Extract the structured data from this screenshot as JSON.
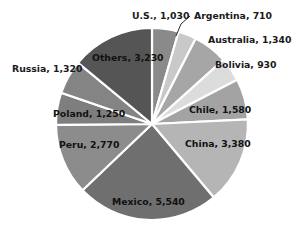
{
  "chart_data": {
    "type": "pie",
    "title": "",
    "subtitle": "",
    "xlabel": "",
    "ylabel": "",
    "legend_position": "none",
    "grid": false,
    "total": 24080,
    "categories": [
      "U.S.",
      "Argentina",
      "Australia",
      "Bolivia",
      "Chile",
      "China",
      "Mexico",
      "Peru",
      "Poland",
      "Russia",
      "Others"
    ],
    "values": [
      1030,
      710,
      1340,
      930,
      1580,
      3380,
      5540,
      2770,
      1250,
      1320,
      3230
    ],
    "slices": [
      {
        "label": "U.S., 1,030",
        "name": "U.S.",
        "value": 1030,
        "color": "#8a8a8a",
        "label_place": "outside"
      },
      {
        "label": "Argentina, 710",
        "name": "Argentina",
        "value": 710,
        "color": "#c9c9c9",
        "label_place": "outside-leader"
      },
      {
        "label": "Australia, 1,340",
        "name": "Australia",
        "value": 1340,
        "color": "#a6a6a6",
        "label_place": "outside"
      },
      {
        "label": "Bolivia, 930",
        "name": "Bolivia",
        "value": 930,
        "color": "#dcdcdc",
        "label_place": "outside"
      },
      {
        "label": "Chile, 1,580",
        "name": "Chile",
        "value": 1580,
        "color": "#a3a3a3",
        "label_place": "inside"
      },
      {
        "label": "China, 3,380",
        "name": "China",
        "value": 3380,
        "color": "#b5b5b5",
        "label_place": "inside"
      },
      {
        "label": "Mexico, 5,540",
        "name": "Mexico",
        "value": 5540,
        "color": "#6f6f6f",
        "label_place": "inside"
      },
      {
        "label": "Peru, 2,770",
        "name": "Peru",
        "value": 2770,
        "color": "#8c8c8c",
        "label_place": "inside"
      },
      {
        "label": "Poland, 1,250",
        "name": "Poland",
        "value": 1250,
        "color": "#7e7e7e",
        "label_place": "inside"
      },
      {
        "label": "Russia, 1,320",
        "name": "Russia",
        "value": 1320,
        "color": "#848484",
        "label_place": "outside"
      },
      {
        "label": "Others, 3,230",
        "name": "Others",
        "value": 3230,
        "color": "#555555",
        "label_place": "inside"
      }
    ],
    "geometry": {
      "center_x": 152,
      "center_y": 124,
      "radius": 96,
      "start_angle_deg": -90
    },
    "label_positions": [
      {
        "key": "U.S.",
        "x": 132,
        "y": 19,
        "anchor": "start"
      },
      {
        "key": "Argentina",
        "x": 194,
        "y": 19,
        "anchor": "start"
      },
      {
        "key": "Australia",
        "x": 208,
        "y": 43,
        "anchor": "start"
      },
      {
        "key": "Bolivia",
        "x": 215,
        "y": 68,
        "anchor": "start"
      },
      {
        "key": "Chile",
        "x": 189,
        "y": 113,
        "anchor": "start"
      },
      {
        "key": "China",
        "x": 185,
        "y": 147,
        "anchor": "start"
      },
      {
        "key": "Mexico",
        "x": 112,
        "y": 205,
        "anchor": "start"
      },
      {
        "key": "Peru",
        "x": 59,
        "y": 148,
        "anchor": "start"
      },
      {
        "key": "Poland",
        "x": 53,
        "y": 117,
        "anchor": "start"
      },
      {
        "key": "Russia",
        "x": 12,
        "y": 72,
        "anchor": "start"
      },
      {
        "key": "Others",
        "x": 92,
        "y": 61,
        "anchor": "start"
      }
    ],
    "leader": {
      "x1": 190,
      "y1": 16,
      "x2": 181,
      "y2": 24,
      "x3": 176,
      "y3": 36
    }
  }
}
